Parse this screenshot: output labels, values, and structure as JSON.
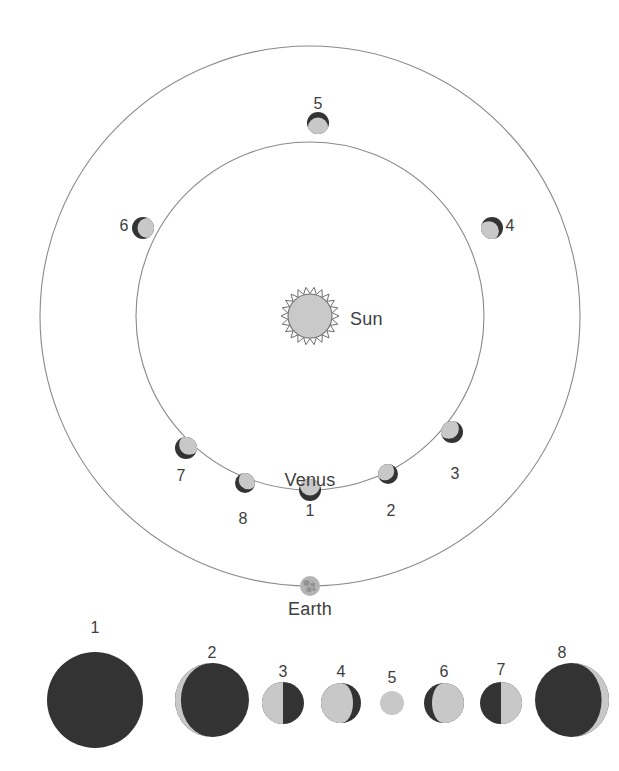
{
  "colors": {
    "dark_side": "#333333",
    "lit_side": "#c8c8c8",
    "orbit_line": "#8a8a8a",
    "sun_fill": "#c9c9c9",
    "sun_stroke": "#6e6e6e",
    "earth_fill": "#b4b4b4",
    "earth_detail": "#8d8d8d",
    "label_text": "#3d3d3d",
    "background": "#ffffff"
  },
  "labels": {
    "sun": "Sun",
    "venus": "Venus",
    "earth": "Earth"
  },
  "orbits": {
    "sun_center": {
      "x": 310,
      "y": 316
    },
    "venus_orbit": {
      "cx": 310,
      "cy": 316,
      "r": 174
    },
    "earth_orbit": {
      "cx": 310,
      "cy": 316,
      "r": 270
    }
  },
  "sun": {
    "radius": 22,
    "ray_count": 22,
    "ray_length": 7,
    "label_x": 350,
    "label_y": 310
  },
  "earth": {
    "x": 310,
    "y": 586,
    "radius": 10,
    "label_x": 310,
    "label_y": 600
  },
  "venus_label": {
    "x": 310,
    "y": 471
  },
  "orbit_positions": [
    {
      "id": "1",
      "angle_deg": 90,
      "x": 310,
      "y": 490,
      "r": 11,
      "lit_direction": "up",
      "label_x": 310,
      "label_y": 503
    },
    {
      "id": "2",
      "angle_deg": 65,
      "x": 388,
      "y": 474,
      "r": 10,
      "lit_direction": "up-left",
      "label_x": 391,
      "label_y": 503
    },
    {
      "id": "3",
      "angle_deg": 35,
      "x": 452,
      "y": 432,
      "r": 11,
      "lit_direction": "up-left",
      "label_x": 455,
      "label_y": 466
    },
    {
      "id": "4",
      "angle_deg": 0,
      "x": 492,
      "y": 228,
      "r": 11,
      "lit_direction": "down-left",
      "label_x": 510,
      "label_y": 218
    },
    {
      "id": "5",
      "angle_deg": 270,
      "x": 318,
      "y": 123,
      "r": 11,
      "lit_direction": "down",
      "label_x": 318,
      "label_y": 96
    },
    {
      "id": "6",
      "angle_deg": 180,
      "x": 143,
      "y": 228,
      "r": 11,
      "lit_direction": "right",
      "label_x": 124,
      "label_y": 218
    },
    {
      "id": "7",
      "angle_deg": 145,
      "x": 186,
      "y": 448,
      "r": 11,
      "lit_direction": "up-right",
      "label_x": 181,
      "label_y": 468
    },
    {
      "id": "8",
      "angle_deg": 115,
      "x": 245,
      "y": 483,
      "r": 10,
      "lit_direction": "up-right",
      "label_x": 243,
      "label_y": 511
    }
  ],
  "phase_row": {
    "baseline_y": 700,
    "disks": [
      {
        "id": "1",
        "cx": 95,
        "cy": 700,
        "r": 48,
        "illuminated_fraction": 0.0,
        "lit_side": "none",
        "label_x": 95,
        "label_y": 620
      },
      {
        "id": "2",
        "cx": 212,
        "cy": 700,
        "r": 37,
        "illuminated_fraction": 0.08,
        "lit_side": "left",
        "label_x": 212,
        "label_y": 645
      },
      {
        "id": "3",
        "cx": 283,
        "cy": 703,
        "r": 21,
        "illuminated_fraction": 0.5,
        "lit_side": "left",
        "label_x": 283,
        "label_y": 664
      },
      {
        "id": "4",
        "cx": 341,
        "cy": 703,
        "r": 20,
        "illuminated_fraction": 0.8,
        "lit_side": "left",
        "label_x": 341,
        "label_y": 664
      },
      {
        "id": "5",
        "cx": 392,
        "cy": 703,
        "r": 12,
        "illuminated_fraction": 1.0,
        "lit_side": "full",
        "label_x": 392,
        "label_y": 670
      },
      {
        "id": "6",
        "cx": 444,
        "cy": 703,
        "r": 20,
        "illuminated_fraction": 0.8,
        "lit_side": "right",
        "label_x": 444,
        "label_y": 664
      },
      {
        "id": "7",
        "cx": 501,
        "cy": 703,
        "r": 21,
        "illuminated_fraction": 0.5,
        "lit_side": "right",
        "label_x": 501,
        "label_y": 662
      },
      {
        "id": "8",
        "cx": 572,
        "cy": 700,
        "r": 37,
        "illuminated_fraction": 0.1,
        "lit_side": "right",
        "label_x": 562,
        "label_y": 645
      }
    ]
  }
}
